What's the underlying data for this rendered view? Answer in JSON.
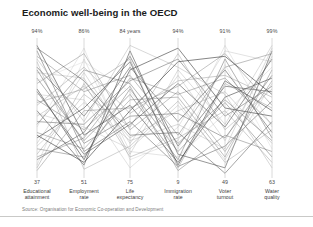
{
  "header": {
    "title": "Economic well-being in the OECD"
  },
  "footer": {
    "source": "Source: Organisation for Economic Co-operation and Development"
  },
  "chart_data": {
    "type": "line",
    "subtype": "parallel-coordinates",
    "title": "Economic well-being in the OECD",
    "xlabel": "",
    "ylabel": "",
    "grid": false,
    "legend": "none",
    "source": "Source: Organisation for Economic Co-operation and Development",
    "axes": [
      {
        "name": "Educational attainment",
        "name_line1": "Educational",
        "name_line2": "attainment",
        "max_label": "94%",
        "min_label": "37",
        "max": 94,
        "min": 37,
        "x": 37
      },
      {
        "name": "Employment rate",
        "name_line1": "Employment",
        "name_line2": "rate",
        "max_label": "86%",
        "min_label": "51",
        "max": 86,
        "min": 51,
        "x": 84
      },
      {
        "name": "Life expectancy",
        "name_line1": "Life",
        "name_line2": "expectancy",
        "max_label": "84 years",
        "min_label": "75",
        "max": 84,
        "min": 75,
        "x": 130
      },
      {
        "name": "Immigration rate",
        "name_line1": "Immigration",
        "name_line2": "rate",
        "max_label": "94%",
        "min_label": "9",
        "max": 94,
        "min": 9,
        "x": 178
      },
      {
        "name": "Voter turnout",
        "name_line1": "Voter",
        "name_line2": "turnout",
        "max_label": "91%",
        "min_label": "49",
        "max": 91,
        "min": 49,
        "x": 225
      },
      {
        "name": "Water quality",
        "name_line1": "Water",
        "name_line2": "quality",
        "max_label": "99%",
        "min_label": "63",
        "max": 99,
        "min": 63,
        "x": 272
      }
    ],
    "plot_area": {
      "left": 37,
      "right": 272,
      "top": 40,
      "bottom": 176
    },
    "series": [
      {
        "name": "country-01",
        "shade": "#3c3c3c",
        "opacity": 0.82,
        "values": [
          0.96,
          0.3,
          0.52,
          0.1,
          0.58,
          0.72
        ]
      },
      {
        "name": "country-02",
        "shade": "#555555",
        "opacity": 0.72,
        "values": [
          0.92,
          0.18,
          0.4,
          0.07,
          0.22,
          0.55
        ]
      },
      {
        "name": "country-03",
        "shade": "#6a6a6a",
        "opacity": 0.62,
        "values": [
          0.88,
          0.62,
          0.74,
          0.3,
          0.8,
          0.9
        ]
      },
      {
        "name": "country-04",
        "shade": "#8a8a8a",
        "opacity": 0.55,
        "values": [
          0.84,
          0.05,
          0.22,
          0.55,
          0.1,
          0.34
        ]
      },
      {
        "name": "country-05",
        "shade": "#4a4a4a",
        "opacity": 0.78,
        "values": [
          0.8,
          0.44,
          0.88,
          0.22,
          0.66,
          0.62
        ]
      },
      {
        "name": "country-06",
        "shade": "#9a9a9a",
        "opacity": 0.5,
        "values": [
          0.76,
          0.72,
          0.16,
          0.78,
          0.38,
          0.96
        ]
      },
      {
        "name": "country-07",
        "shade": "#5e5e5e",
        "opacity": 0.68,
        "values": [
          0.72,
          0.26,
          0.6,
          0.12,
          0.86,
          0.28
        ]
      },
      {
        "name": "country-08",
        "shade": "#707070",
        "opacity": 0.6,
        "values": [
          0.68,
          0.9,
          0.34,
          0.62,
          0.18,
          0.7
        ]
      },
      {
        "name": "country-09",
        "shade": "#383838",
        "opacity": 0.85,
        "values": [
          0.64,
          0.12,
          0.78,
          0.94,
          0.5,
          0.44
        ]
      },
      {
        "name": "country-10",
        "shade": "#a5a5a5",
        "opacity": 0.46,
        "values": [
          0.6,
          0.56,
          0.06,
          0.36,
          0.92,
          0.84
        ]
      },
      {
        "name": "country-11",
        "shade": "#656565",
        "opacity": 0.64,
        "values": [
          0.56,
          0.34,
          0.66,
          0.04,
          0.3,
          0.18
        ]
      },
      {
        "name": "country-12",
        "shade": "#7d7d7d",
        "opacity": 0.56,
        "values": [
          0.52,
          0.8,
          0.46,
          0.7,
          0.74,
          0.58
        ]
      },
      {
        "name": "country-13",
        "shade": "#444444",
        "opacity": 0.8,
        "values": [
          0.48,
          0.08,
          0.92,
          0.16,
          0.06,
          0.92
        ]
      },
      {
        "name": "country-14",
        "shade": "#909090",
        "opacity": 0.52,
        "values": [
          0.44,
          0.66,
          0.28,
          0.48,
          0.62,
          0.24
        ]
      },
      {
        "name": "country-15",
        "shade": "#585858",
        "opacity": 0.7,
        "values": [
          0.4,
          0.38,
          0.7,
          0.86,
          0.44,
          0.66
        ]
      },
      {
        "name": "country-16",
        "shade": "#b0b0b0",
        "opacity": 0.42,
        "values": [
          0.36,
          0.94,
          0.12,
          0.26,
          0.96,
          0.36
        ]
      },
      {
        "name": "country-17",
        "shade": "#6e6e6e",
        "opacity": 0.62,
        "values": [
          0.32,
          0.2,
          0.56,
          0.58,
          0.14,
          0.78
        ]
      },
      {
        "name": "country-18",
        "shade": "#3f3f3f",
        "opacity": 0.84,
        "values": [
          0.28,
          0.5,
          0.84,
          0.08,
          0.7,
          0.48
        ]
      },
      {
        "name": "country-19",
        "shade": "#999999",
        "opacity": 0.48,
        "values": [
          0.24,
          0.76,
          0.24,
          0.74,
          0.26,
          0.88
        ]
      },
      {
        "name": "country-20",
        "shade": "#616161",
        "opacity": 0.66,
        "values": [
          0.2,
          0.14,
          0.64,
          0.18,
          0.54,
          0.14
        ]
      },
      {
        "name": "country-21",
        "shade": "#848484",
        "opacity": 0.54,
        "values": [
          0.16,
          0.6,
          0.36,
          0.9,
          0.34,
          0.64
        ]
      },
      {
        "name": "country-22",
        "shade": "#4e4e4e",
        "opacity": 0.76,
        "values": [
          0.12,
          0.32,
          0.8,
          0.4,
          0.78,
          0.32
        ]
      },
      {
        "name": "country-23",
        "shade": "#aaaaaa",
        "opacity": 0.44,
        "values": [
          0.08,
          0.86,
          0.18,
          0.14,
          0.46,
          0.8
        ]
      },
      {
        "name": "country-24",
        "shade": "#727272",
        "opacity": 0.6,
        "values": [
          0.04,
          0.48,
          0.5,
          0.66,
          0.9,
          0.52
        ]
      },
      {
        "name": "country-25",
        "shade": "#505050",
        "opacity": 0.74,
        "values": [
          0.94,
          0.7,
          0.3,
          0.32,
          0.02,
          0.4
        ]
      },
      {
        "name": "country-26",
        "shade": "#8f8f8f",
        "opacity": 0.5,
        "values": [
          0.86,
          0.4,
          0.96,
          0.8,
          0.6,
          0.06
        ]
      },
      {
        "name": "country-27",
        "shade": "#5a5a5a",
        "opacity": 0.7,
        "values": [
          0.78,
          0.24,
          0.44,
          0.46,
          0.28,
          0.74
        ]
      },
      {
        "name": "country-28",
        "shade": "#bdbdbd",
        "opacity": 0.4,
        "values": [
          0.7,
          0.84,
          0.62,
          0.2,
          0.82,
          0.2
        ]
      },
      {
        "name": "country-29",
        "shade": "#474747",
        "opacity": 0.8,
        "values": [
          0.62,
          0.16,
          0.38,
          0.68,
          0.36,
          0.86
        ]
      },
      {
        "name": "country-30",
        "shade": "#7a7a7a",
        "opacity": 0.58,
        "values": [
          0.54,
          0.64,
          0.86,
          0.06,
          0.68,
          0.5
        ]
      },
      {
        "name": "country-31",
        "shade": "#9e9e9e",
        "opacity": 0.46,
        "values": [
          0.46,
          0.36,
          0.2,
          0.52,
          0.12,
          0.68
        ]
      },
      {
        "name": "country-32",
        "shade": "#636363",
        "opacity": 0.66,
        "values": [
          0.38,
          0.78,
          0.68,
          0.24,
          0.56,
          0.26
        ]
      },
      {
        "name": "country-33",
        "shade": "#353535",
        "opacity": 0.86,
        "values": [
          0.3,
          0.1,
          0.48,
          0.84,
          0.88,
          0.6
        ]
      },
      {
        "name": "country-34",
        "shade": "#969696",
        "opacity": 0.48,
        "values": [
          0.22,
          0.54,
          0.26,
          0.38,
          0.2,
          0.94
        ]
      },
      {
        "name": "country-35",
        "shade": "#6b6b6b",
        "opacity": 0.62,
        "values": [
          0.14,
          0.28,
          0.72,
          0.6,
          0.72,
          0.38
        ]
      },
      {
        "name": "country-36",
        "shade": "#808080",
        "opacity": 0.56,
        "values": [
          0.06,
          0.68,
          0.14,
          0.28,
          0.48,
          0.1
        ]
      }
    ]
  }
}
